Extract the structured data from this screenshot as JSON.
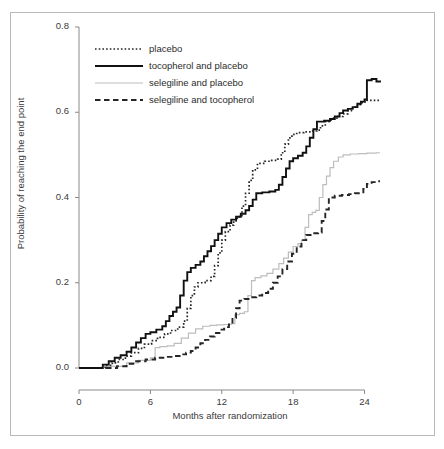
{
  "figure": {
    "border_color": "#b9b9b9"
  },
  "axes": {
    "x_title": "Months after randomization",
    "y_title": "Probability of reaching the end point",
    "x_ticks": [
      "0",
      "6",
      "12",
      "18",
      "24"
    ],
    "y_ticks": [
      "0.0",
      "0.2",
      "0.4",
      "0.6",
      "0.8"
    ],
    "axis_color": "#8a8a8a"
  },
  "legend": {
    "items": [
      {
        "label": "placebo",
        "style": "dotted",
        "color": "#262626"
      },
      {
        "label": "tocopherol and placebo",
        "style": "solid",
        "color": "#111111"
      },
      {
        "label": "selegiline and placebo",
        "style": "solid-light",
        "color": "#bdbdbd"
      },
      {
        "label": "selegiline and tocopherol",
        "style": "dashed",
        "color": "#262626"
      }
    ]
  },
  "chart_data": {
    "type": "line",
    "title": "",
    "subtitle": "",
    "xlabel": "Months after randomization",
    "ylabel": "Probability of reaching the end point",
    "xlim": [
      0,
      25.3
    ],
    "ylim": [
      0.0,
      0.8
    ],
    "xticks": [
      0,
      6,
      12,
      18,
      24
    ],
    "yticks": [
      0.0,
      0.2,
      0.4,
      0.6,
      0.8
    ],
    "grid": false,
    "legend_position": "top-left-inside",
    "step_curves": true,
    "annotations": [],
    "series": [
      {
        "name": "placebo",
        "style": "dotted",
        "color": "#262626",
        "points": [
          [
            0.0,
            0.0
          ],
          [
            1.6,
            0.0
          ],
          [
            2.2,
            0.006
          ],
          [
            2.8,
            0.012
          ],
          [
            3.3,
            0.02
          ],
          [
            3.9,
            0.028
          ],
          [
            4.4,
            0.036
          ],
          [
            5.0,
            0.046
          ],
          [
            5.5,
            0.056
          ],
          [
            6.1,
            0.064
          ],
          [
            6.6,
            0.072
          ],
          [
            7.2,
            0.08
          ],
          [
            7.7,
            0.088
          ],
          [
            8.3,
            0.096
          ],
          [
            8.8,
            0.11
          ],
          [
            9.1,
            0.14
          ],
          [
            9.4,
            0.17
          ],
          [
            9.7,
            0.19
          ],
          [
            10.0,
            0.2
          ],
          [
            10.6,
            0.205
          ],
          [
            11.1,
            0.215
          ],
          [
            11.4,
            0.24
          ],
          [
            11.7,
            0.27
          ],
          [
            12.0,
            0.3
          ],
          [
            12.3,
            0.32
          ],
          [
            12.7,
            0.335
          ],
          [
            13.0,
            0.345
          ],
          [
            13.3,
            0.355
          ],
          [
            13.7,
            0.38
          ],
          [
            14.0,
            0.41
          ],
          [
            14.3,
            0.44
          ],
          [
            14.6,
            0.465
          ],
          [
            15.0,
            0.48
          ],
          [
            15.6,
            0.485
          ],
          [
            16.2,
            0.487
          ],
          [
            16.7,
            0.49
          ],
          [
            17.0,
            0.505
          ],
          [
            17.3,
            0.525
          ],
          [
            17.6,
            0.54
          ],
          [
            17.9,
            0.548
          ],
          [
            18.3,
            0.552
          ],
          [
            18.9,
            0.554
          ],
          [
            19.5,
            0.556
          ],
          [
            20.0,
            0.558
          ],
          [
            20.3,
            0.568
          ],
          [
            20.7,
            0.578
          ],
          [
            21.0,
            0.582
          ],
          [
            21.4,
            0.586
          ],
          [
            21.8,
            0.59
          ],
          [
            22.2,
            0.596
          ],
          [
            22.6,
            0.604
          ],
          [
            23.0,
            0.612
          ],
          [
            23.4,
            0.618
          ],
          [
            23.8,
            0.624
          ],
          [
            24.2,
            0.628
          ],
          [
            24.8,
            0.628
          ],
          [
            25.3,
            0.628
          ]
        ]
      },
      {
        "name": "tocopherol and placebo",
        "style": "solid",
        "color": "#111111",
        "points": [
          [
            0.0,
            0.0
          ],
          [
            1.5,
            0.0
          ],
          [
            2.0,
            0.008
          ],
          [
            2.5,
            0.016
          ],
          [
            3.0,
            0.024
          ],
          [
            3.5,
            0.03
          ],
          [
            4.0,
            0.038
          ],
          [
            4.4,
            0.048
          ],
          [
            4.8,
            0.06
          ],
          [
            5.2,
            0.07
          ],
          [
            5.6,
            0.08
          ],
          [
            6.0,
            0.084
          ],
          [
            6.5,
            0.09
          ],
          [
            7.0,
            0.098
          ],
          [
            7.3,
            0.11
          ],
          [
            7.6,
            0.122
          ],
          [
            7.9,
            0.132
          ],
          [
            8.2,
            0.142
          ],
          [
            8.5,
            0.17
          ],
          [
            8.8,
            0.205
          ],
          [
            9.1,
            0.225
          ],
          [
            9.4,
            0.235
          ],
          [
            9.8,
            0.242
          ],
          [
            10.2,
            0.25
          ],
          [
            10.5,
            0.262
          ],
          [
            10.8,
            0.274
          ],
          [
            11.1,
            0.286
          ],
          [
            11.4,
            0.3
          ],
          [
            11.7,
            0.315
          ],
          [
            12.0,
            0.33
          ],
          [
            12.4,
            0.34
          ],
          [
            12.8,
            0.348
          ],
          [
            13.2,
            0.355
          ],
          [
            13.6,
            0.362
          ],
          [
            14.0,
            0.37
          ],
          [
            14.3,
            0.38
          ],
          [
            14.6,
            0.395
          ],
          [
            14.9,
            0.41
          ],
          [
            15.4,
            0.412
          ],
          [
            16.0,
            0.414
          ],
          [
            16.5,
            0.418
          ],
          [
            16.8,
            0.43
          ],
          [
            17.1,
            0.448
          ],
          [
            17.4,
            0.468
          ],
          [
            17.7,
            0.485
          ],
          [
            18.0,
            0.492
          ],
          [
            18.4,
            0.498
          ],
          [
            18.8,
            0.505
          ],
          [
            19.1,
            0.52
          ],
          [
            19.4,
            0.54
          ],
          [
            19.7,
            0.56
          ],
          [
            20.0,
            0.578
          ],
          [
            20.6,
            0.58
          ],
          [
            21.1,
            0.584
          ],
          [
            21.5,
            0.59
          ],
          [
            21.9,
            0.598
          ],
          [
            22.2,
            0.604
          ],
          [
            22.6,
            0.608
          ],
          [
            23.0,
            0.612
          ],
          [
            23.4,
            0.62
          ],
          [
            23.7,
            0.625
          ],
          [
            24.0,
            0.63
          ],
          [
            24.2,
            0.675
          ],
          [
            24.6,
            0.678
          ],
          [
            25.0,
            0.672
          ],
          [
            25.3,
            0.67
          ]
        ]
      },
      {
        "name": "selegiline and placebo",
        "style": "solid-light",
        "color": "#bdbdbd",
        "points": [
          [
            0.0,
            0.0
          ],
          [
            2.0,
            0.004
          ],
          [
            4.0,
            0.012
          ],
          [
            5.0,
            0.018
          ],
          [
            6.0,
            0.024
          ],
          [
            6.4,
            0.048
          ],
          [
            6.8,
            0.05
          ],
          [
            7.4,
            0.052
          ],
          [
            8.0,
            0.058
          ],
          [
            8.6,
            0.07
          ],
          [
            9.2,
            0.082
          ],
          [
            9.8,
            0.092
          ],
          [
            10.4,
            0.098
          ],
          [
            11.0,
            0.1
          ],
          [
            11.6,
            0.101
          ],
          [
            12.2,
            0.102
          ],
          [
            12.8,
            0.104
          ],
          [
            13.1,
            0.125
          ],
          [
            13.5,
            0.128
          ],
          [
            13.9,
            0.132
          ],
          [
            14.2,
            0.17
          ],
          [
            14.5,
            0.205
          ],
          [
            14.8,
            0.212
          ],
          [
            15.3,
            0.216
          ],
          [
            15.8,
            0.222
          ],
          [
            16.3,
            0.232
          ],
          [
            16.8,
            0.245
          ],
          [
            17.2,
            0.258
          ],
          [
            17.6,
            0.272
          ],
          [
            18.0,
            0.285
          ],
          [
            18.4,
            0.292
          ],
          [
            18.7,
            0.3
          ],
          [
            19.0,
            0.33
          ],
          [
            19.3,
            0.36
          ],
          [
            19.6,
            0.365
          ],
          [
            19.9,
            0.37
          ],
          [
            20.2,
            0.4
          ],
          [
            20.5,
            0.43
          ],
          [
            20.8,
            0.45
          ],
          [
            21.1,
            0.47
          ],
          [
            21.4,
            0.485
          ],
          [
            21.8,
            0.495
          ],
          [
            22.2,
            0.5
          ],
          [
            22.8,
            0.502
          ],
          [
            23.5,
            0.503
          ],
          [
            24.2,
            0.504
          ],
          [
            25.0,
            0.505
          ],
          [
            25.3,
            0.505
          ]
        ]
      },
      {
        "name": "selegiline and tocopherol",
        "style": "dashed",
        "color": "#262626",
        "points": [
          [
            0.0,
            0.0
          ],
          [
            2.5,
            0.0
          ],
          [
            3.2,
            0.004
          ],
          [
            4.0,
            0.01
          ],
          [
            4.8,
            0.016
          ],
          [
            5.6,
            0.02
          ],
          [
            6.4,
            0.024
          ],
          [
            7.2,
            0.026
          ],
          [
            8.0,
            0.028
          ],
          [
            8.6,
            0.032
          ],
          [
            9.0,
            0.036
          ],
          [
            9.4,
            0.04
          ],
          [
            9.8,
            0.048
          ],
          [
            10.2,
            0.058
          ],
          [
            10.6,
            0.066
          ],
          [
            11.0,
            0.074
          ],
          [
            11.4,
            0.082
          ],
          [
            11.8,
            0.09
          ],
          [
            12.2,
            0.096
          ],
          [
            12.6,
            0.102
          ],
          [
            12.9,
            0.118
          ],
          [
            13.2,
            0.14
          ],
          [
            13.5,
            0.158
          ],
          [
            13.9,
            0.162
          ],
          [
            14.4,
            0.166
          ],
          [
            14.9,
            0.17
          ],
          [
            15.4,
            0.176
          ],
          [
            15.9,
            0.186
          ],
          [
            16.3,
            0.2
          ],
          [
            16.7,
            0.215
          ],
          [
            17.1,
            0.232
          ],
          [
            17.5,
            0.25
          ],
          [
            17.9,
            0.268
          ],
          [
            18.3,
            0.285
          ],
          [
            18.7,
            0.3
          ],
          [
            19.1,
            0.312
          ],
          [
            19.6,
            0.316
          ],
          [
            20.1,
            0.318
          ],
          [
            20.4,
            0.345
          ],
          [
            20.7,
            0.372
          ],
          [
            21.0,
            0.4
          ],
          [
            21.5,
            0.404
          ],
          [
            22.1,
            0.406
          ],
          [
            22.7,
            0.408
          ],
          [
            23.2,
            0.41
          ],
          [
            23.6,
            0.412
          ],
          [
            23.9,
            0.42
          ],
          [
            24.2,
            0.432
          ],
          [
            24.6,
            0.436
          ],
          [
            25.0,
            0.438
          ],
          [
            25.3,
            0.438
          ]
        ]
      }
    ]
  }
}
